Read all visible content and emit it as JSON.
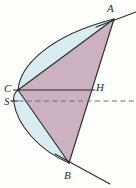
{
  "figure": {
    "kind": "geometry-diagram",
    "background_color": "#fdfdfb",
    "stroke_color": "#2b2b2b",
    "triangle_fill": "#c9a8b8",
    "segment_fill": "#d8ecf2",
    "labels": [
      {
        "id": "A",
        "text": "A",
        "x": 107,
        "y": 3
      },
      {
        "id": "B",
        "text": "B",
        "x": 64,
        "y": 170
      },
      {
        "id": "C",
        "text": "C",
        "x": 4,
        "y": 83
      },
      {
        "id": "S",
        "text": "S",
        "x": 4,
        "y": 96
      },
      {
        "id": "H",
        "text": "H",
        "x": 96,
        "y": 82
      }
    ],
    "points": {
      "A": {
        "x": 114,
        "y": 19
      },
      "B": {
        "x": 69,
        "y": 163
      },
      "C": {
        "x": 18,
        "y": 90
      },
      "S": {
        "x": 14,
        "y": 101
      },
      "H": {
        "x": 93,
        "y": 90
      }
    },
    "chords": [
      {
        "name": "chord-AB",
        "from": "A",
        "to": "B"
      },
      {
        "name": "chord-CA",
        "from": "C",
        "to": "A"
      },
      {
        "name": "chord-CB",
        "from": "C",
        "to": "B"
      },
      {
        "name": "chord-CH",
        "from": "C",
        "to": "H"
      }
    ],
    "axis": {
      "name": "axis-SH",
      "style": "dashed",
      "from_x": 10,
      "to_x": 136,
      "y": 101
    },
    "tangents": [
      {
        "name": "tangent-at-A",
        "from_x": 98,
        "from_y": 26,
        "to_x": 136,
        "to_y": 12
      },
      {
        "name": "tangent-at-B",
        "from_x": 56,
        "from_y": 155,
        "to_x": 110,
        "to_y": 183
      }
    ]
  }
}
